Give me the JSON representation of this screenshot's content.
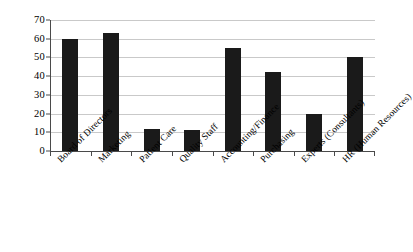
{
  "chart_data": {
    "type": "bar",
    "title": "",
    "subtitle": "",
    "xlabel": "",
    "ylabel": "",
    "ylim": [
      0,
      70
    ],
    "yticks": [
      0,
      10,
      20,
      30,
      40,
      50,
      60,
      70
    ],
    "ytick_labels": [
      "0",
      "10",
      "20",
      "30",
      "40",
      "50",
      "60",
      "70"
    ],
    "grid": true,
    "legend": false,
    "legend_position": "none",
    "bar_color": "#1a1a1a",
    "gridline_color": "#c9c9c9",
    "axis_color": "#4a4a4a",
    "background_color": "#ffffff",
    "xtick_label_rotation": -45,
    "categories": [
      "Board of Directors",
      "Marketing",
      "Patient Care",
      "Quality Staff",
      "Accounting/Finance",
      "Purchasing",
      "Experts (Consultants)",
      "HR (Human Resources)"
    ],
    "values": [
      60,
      63,
      12,
      11,
      55,
      42,
      20,
      50
    ]
  }
}
